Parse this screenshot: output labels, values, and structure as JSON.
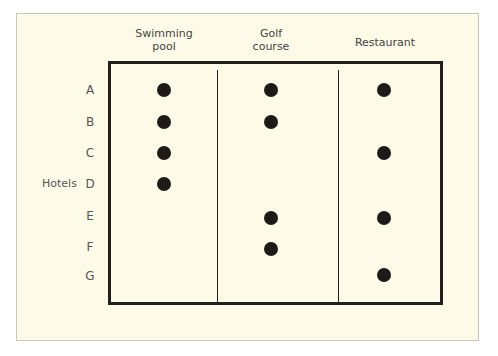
{
  "chart_data": {
    "type": "table",
    "title": "",
    "row_axis_label": "Hotels",
    "columns": [
      "Swimming pool",
      "Golf course",
      "Restaurant"
    ],
    "rows": [
      "A",
      "B",
      "C",
      "D",
      "E",
      "F",
      "G"
    ],
    "values": [
      [
        1,
        1,
        1
      ],
      [
        1,
        1,
        0
      ],
      [
        1,
        0,
        1
      ],
      [
        1,
        0,
        0
      ],
      [
        0,
        1,
        1
      ],
      [
        0,
        1,
        0
      ],
      [
        0,
        0,
        1
      ]
    ]
  },
  "headers": {
    "col0_line1": "Swimming",
    "col0_line2": "pool",
    "col1_line1": "Golf",
    "col1_line2": "course",
    "col2": "Restaurant"
  },
  "row_axis_label": "Hotels",
  "rows": [
    "A",
    "B",
    "C",
    "D",
    "E",
    "F",
    "G"
  ],
  "colors": {
    "background": "#fdfbe8",
    "line": "#231f1c",
    "dot": "#1f1a18"
  }
}
